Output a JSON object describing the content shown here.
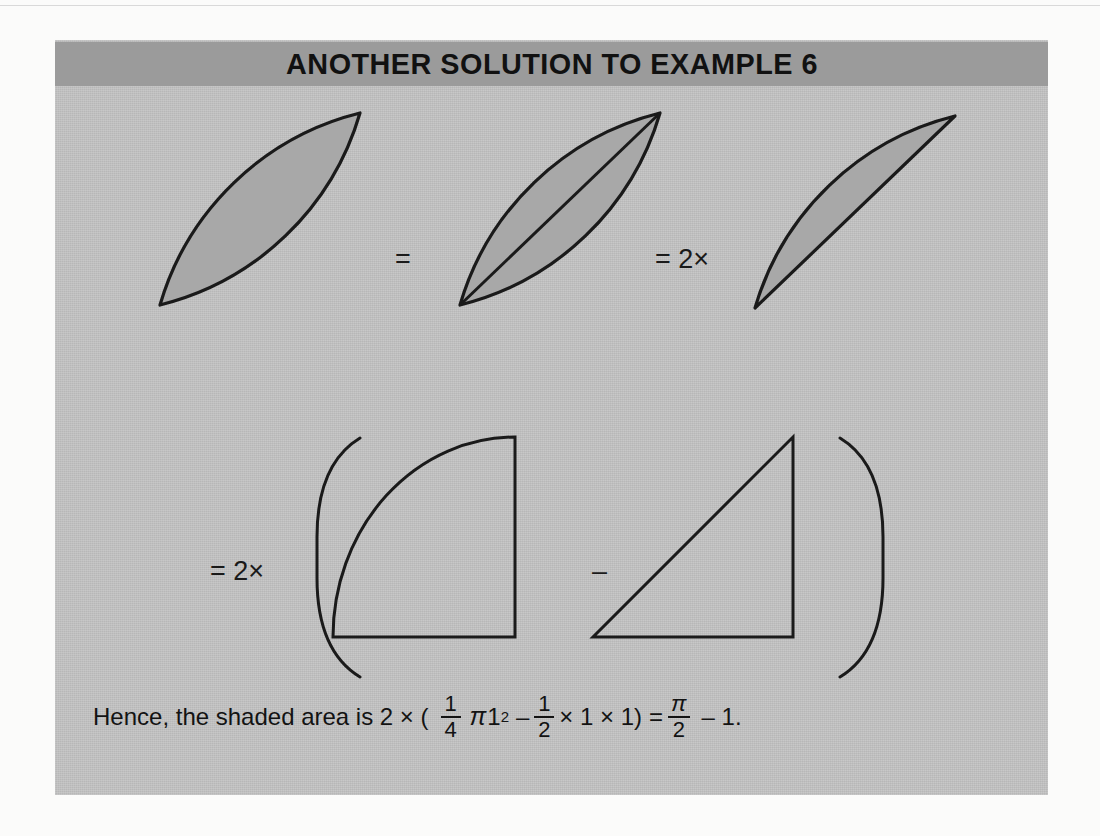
{
  "banner": {
    "title": "ANOTHER SOLUTION TO EXAMPLE 6"
  },
  "operators": {
    "equals": "=",
    "equals_two_times_row1": "= 2×",
    "equals_two_times_row2": "= 2×",
    "minus": "–"
  },
  "figures": {
    "row1": [
      {
        "name": "lens",
        "label": "shaded lens (vesica) shape"
      },
      {
        "name": "lens-split",
        "label": "shaded lens divided by diagonal chord"
      },
      {
        "name": "half-lens",
        "label": "shaded circular segment (half lens)"
      }
    ],
    "row2": [
      {
        "name": "quarter-circle",
        "label": "quarter circle sector"
      },
      {
        "name": "right-triangle",
        "label": "right triangle"
      }
    ]
  },
  "conclusion": {
    "lead": "Hence, the shaded area is 2 × (",
    "frac1_num": "1",
    "frac1_den": "4",
    "pi": "π",
    "one": "1",
    "exponent": "2",
    "minus": "–",
    "frac2_num": "1",
    "frac2_den": "2",
    "times_one": "× 1 × 1)",
    "equals": "=",
    "frac3_num": "π",
    "frac3_den": "2",
    "tail": "– 1."
  },
  "colors": {
    "page_background": "#fbfbfa",
    "panel_background": "#c3c3c3",
    "banner_background": "#9b9b9b",
    "shape_fill": "#a8a8a8",
    "shape_stroke": "#1a1a1a",
    "text": "#131313"
  }
}
